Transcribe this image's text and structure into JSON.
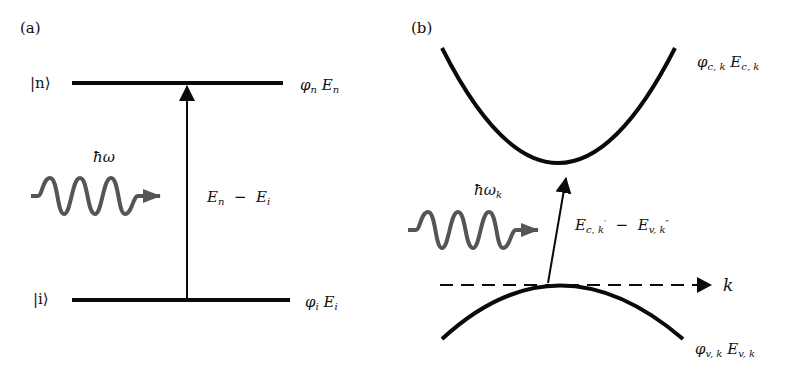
{
  "panel_a": {
    "tag": "(a)",
    "upper_level": {
      "ket_label": "|n⟩",
      "state_symbol": "φ",
      "state_sub": "n",
      "energy_symbol": "E",
      "energy_sub": "n"
    },
    "lower_level": {
      "ket_label": "|i⟩",
      "state_symbol": "φ",
      "state_sub": "i",
      "energy_symbol": "E",
      "energy_sub": "i"
    },
    "photon_label": "ħω",
    "transition_label": {
      "e1": "E",
      "e1_sub": "n",
      "minus": "−",
      "e2": "E",
      "e2_sub": "i"
    }
  },
  "panel_b": {
    "tag": "(b)",
    "conduction_band": {
      "state_symbol": "φ",
      "state_sub": "c, k",
      "energy_symbol": "E",
      "energy_sub": "c, k"
    },
    "valence_band": {
      "state_symbol": "φ",
      "state_sub": "v, k",
      "energy_symbol": "E",
      "energy_sub": "v, k"
    },
    "photon_label": "ħω",
    "photon_sub": "k",
    "transition_label": {
      "e1": "E",
      "e1_sub": "c, k",
      "e1_prime": "′",
      "minus": "−",
      "e2": "E",
      "e2_sub": "v, k",
      "e2_prime": "″"
    },
    "axis_label": "k"
  },
  "colors": {
    "line": "#0a0a0a",
    "photon_wave": "#555555",
    "background": "#ffffff"
  }
}
